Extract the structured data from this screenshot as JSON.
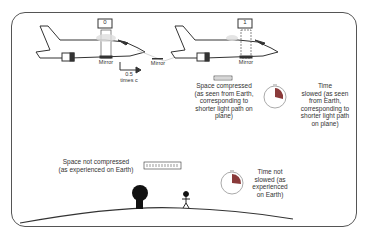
{
  "diagram": {
    "plane_left": {
      "counter": "0",
      "mirror_label": "Mirror",
      "velocity_label": "0.5\ntimes c"
    },
    "plane_right": {
      "counter": "1",
      "mirror_label": "Mirror"
    },
    "ground_mirror_label": "Mirror",
    "space_compressed_label": "Space compressed\n(as seen from Earth,\ncorresponding to\nshorter light path on\nplane)",
    "time_slowed_label": "Time\nslowed (as seen\nfrom Earth,\ncorresponding to\nshorter light path\non plane)",
    "space_not_compressed_label": "Space not compressed\n(as experienced on Earth)",
    "time_not_slowed_label": "Time not\nslowed (as\nexperienced\non Earth)",
    "colors": {
      "outline": "#333333",
      "clock_wedge": "#8a3a3a",
      "light_glow": "#d9d9d9"
    }
  }
}
